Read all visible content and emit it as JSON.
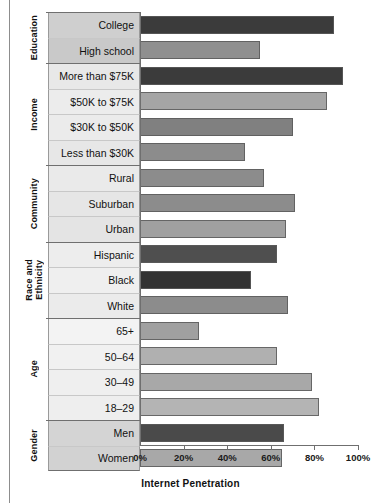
{
  "chart_data": {
    "type": "bar",
    "orientation": "horizontal",
    "title": "",
    "xlabel": "Internet Penetration",
    "ylabel": "",
    "xlim": [
      0,
      100
    ],
    "xticks": [
      "0%",
      "20%",
      "40%",
      "60%",
      "80%",
      "100%"
    ],
    "xtick_values": [
      0,
      20,
      40,
      60,
      80,
      100
    ],
    "grid": false,
    "legend": false,
    "categories": [
      "College",
      "High school",
      "More than $75K",
      "$50K to $75K",
      "$30K to $50K",
      "Less than $30K",
      "Rural",
      "Suburban",
      "Urban",
      "Hispanic",
      "Black",
      "White",
      "65+",
      "50–64",
      "30–49",
      "18–29",
      "Men",
      "Women"
    ],
    "values": [
      89,
      55,
      93,
      86,
      70,
      48,
      57,
      71,
      67,
      63,
      51,
      68,
      27,
      63,
      79,
      82,
      66,
      65
    ],
    "bar_colors": [
      "#3b3b3b",
      "#8f8f8f",
      "#3b3b3b",
      "#a5a5a5",
      "#808080",
      "#8c8c8c",
      "#8c8c8c",
      "#8c8c8c",
      "#a0a0a0",
      "#4f4f4f",
      "#333333",
      "#8c8c8c",
      "#a0a0a0",
      "#b0b0b0",
      "#a8a8a8",
      "#b4b4b4",
      "#4a4a4a",
      "#a8a8a8"
    ],
    "groups": [
      {
        "label": "Education",
        "rows": [
          "College",
          "High school"
        ]
      },
      {
        "label": "Income",
        "rows": [
          "More than $75K",
          "$50K to $75K",
          "$30K to $50K",
          "Less than $30K"
        ]
      },
      {
        "label": "Community",
        "rows": [
          "Rural",
          "Suburban",
          "Urban"
        ]
      },
      {
        "label": "Race and\nEthnicity",
        "rows": [
          "Hispanic",
          "Black",
          "White"
        ]
      },
      {
        "label": "Age",
        "rows": [
          "65+",
          "50–64",
          "30–49",
          "18–29"
        ]
      },
      {
        "label": "Gender",
        "rows": [
          "Men",
          "Women"
        ]
      }
    ],
    "row_shades": [
      "#cfcfcf",
      "#c9c9c9",
      "#e8e8e8",
      "#ececec",
      "#ebebeb",
      "#e7e7e7",
      "#eaeaea",
      "#e6e6e6",
      "#e4e4e4",
      "#ededed",
      "#efefef",
      "#ebebeb",
      "#f3f3f3",
      "#f1f1f1",
      "#efefef",
      "#eeeeee",
      "#d4d4d4",
      "#d2d2d2"
    ]
  },
  "axis": {
    "title": "Internet Penetration",
    "ticks": [
      {
        "label": "0%",
        "value": 0
      },
      {
        "label": "20%",
        "value": 20
      },
      {
        "label": "40%",
        "value": 40
      },
      {
        "label": "60%",
        "value": 60
      },
      {
        "label": "80%",
        "value": 80
      },
      {
        "label": "100%",
        "value": 100
      }
    ]
  },
  "group_labels": [
    "Education",
    "Income",
    "Community",
    "Race and Ethnicity",
    "Age",
    "Gender"
  ]
}
